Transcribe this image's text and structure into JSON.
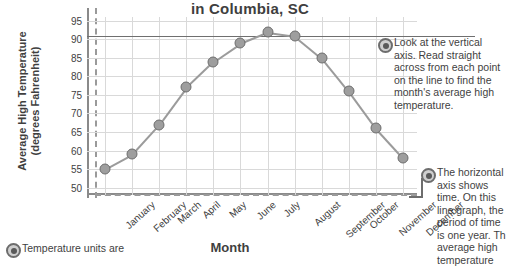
{
  "chart_data": {
    "type": "line",
    "title": "in Columbia, SC",
    "xlabel": "Month",
    "ylabel_line1": "Average High Temperature",
    "ylabel_line2": "(degrees Fahrenheit)",
    "categories": [
      "January",
      "February",
      "March",
      "April",
      "May",
      "June",
      "July",
      "August",
      "September",
      "October",
      "November",
      "December"
    ],
    "values": [
      55,
      59,
      67,
      77,
      84,
      89,
      92,
      91,
      85,
      76,
      66,
      58
    ],
    "yticks": [
      50,
      55,
      60,
      65,
      70,
      75,
      80,
      85,
      90,
      95
    ],
    "ylim": [
      48,
      96
    ],
    "grid": true,
    "legend": "none",
    "reference_line": 91,
    "units": "degrees Fahrenheit"
  },
  "callouts": {
    "vertical_axis": "Look at the vertical axis. Read straight across from each point on the line to find the month's average high temperature.",
    "horizontal_axis": "The horizontal axis shows time. On this line graph, the period of time is one year. Th average high temperature",
    "units_note": "Temperature units are"
  }
}
